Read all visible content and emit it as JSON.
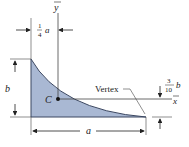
{
  "diagram": {
    "shape": "spandrel (parabolic) area",
    "fill_color": "#a9b8d3",
    "edge_color": "#3a4660",
    "labels": {
      "y_axis": "y",
      "x_axis": "x",
      "centroid": "C",
      "vertex": "Vertex",
      "height": "b",
      "width": "a",
      "xc_num": "1",
      "xc_den": "4",
      "xc_var": "a",
      "yc_num": "3",
      "yc_den": "10",
      "yc_var": "b"
    }
  }
}
